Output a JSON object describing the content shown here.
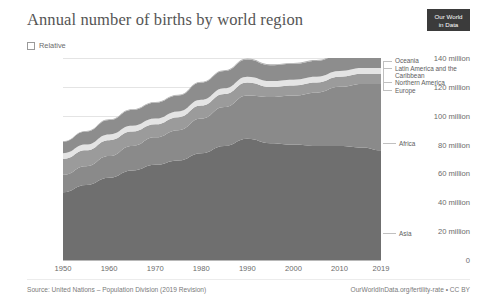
{
  "header": {
    "title": "Annual number of births by world region",
    "logo_line1": "Our World",
    "logo_line2": "in Data",
    "relative_label": "Relative"
  },
  "footer": {
    "source": "Source: United Nations – Population Division (2019 Revision)",
    "attribution": "OurWorldInData.org/fertility-rate • CC BY"
  },
  "legend": {
    "oceania": "Oceania",
    "latin_america": "Latin America and the Caribbean",
    "northern_america": "Northern America",
    "europe": "Europe",
    "africa": "Africa",
    "asia": "Asia"
  },
  "chart_data": {
    "type": "area",
    "title": "Annual number of births by world region",
    "subtitle": "",
    "xlabel": "",
    "ylabel": "",
    "stacked": true,
    "grid": true,
    "legend_position": "right",
    "xlim": [
      1950,
      2019
    ],
    "ylim": [
      0,
      140
    ],
    "y_unit": "million",
    "yticks": [
      0,
      20,
      40,
      60,
      80,
      100,
      120,
      140
    ],
    "ytick_labels": [
      "0",
      "20 million",
      "40 million",
      "60 million",
      "80 million",
      "100 million",
      "120 million",
      "140 million"
    ],
    "xticks": [
      1950,
      1960,
      1970,
      1980,
      1990,
      2000,
      2010,
      2019
    ],
    "xtick_labels": [
      "1950",
      "1960",
      "1970",
      "1980",
      "1990",
      "2000",
      "2010",
      "2019"
    ],
    "x": [
      1950,
      1955,
      1960,
      1965,
      1970,
      1975,
      1980,
      1985,
      1990,
      1995,
      2000,
      2005,
      2010,
      2015,
      2019
    ],
    "series": [
      {
        "name": "Asia",
        "color": "#6f6f6f",
        "values": [
          47,
          52,
          57,
          62,
          66,
          69,
          74,
          79,
          84,
          81,
          80,
          79,
          79,
          78,
          76
        ]
      },
      {
        "name": "Africa",
        "color": "#8a8a8a",
        "values": [
          12,
          13,
          15,
          17,
          19,
          21,
          24,
          27,
          30,
          32,
          34,
          37,
          41,
          44,
          46
        ]
      },
      {
        "name": "Europe",
        "color": "#9b9b9b",
        "values": [
          11,
          11,
          11,
          10,
          9,
          9,
          9,
          9,
          9,
          7,
          7,
          7,
          7,
          7,
          7
        ]
      },
      {
        "name": "Northern America",
        "color": "#e4e4e4",
        "values": [
          4,
          4,
          4,
          4,
          4,
          4,
          4,
          4,
          4,
          4,
          4,
          4,
          4,
          4,
          4
        ]
      },
      {
        "name": "Latin America and the Caribbean",
        "color": "#8d8d8d",
        "values": [
          8,
          9,
          10,
          11,
          11,
          11,
          12,
          12,
          12,
          11,
          11,
          11,
          11,
          10,
          10
        ]
      },
      {
        "name": "Oceania",
        "color": "#b0b0b0",
        "values": [
          0.4,
          0.4,
          0.5,
          0.5,
          0.5,
          0.5,
          0.5,
          0.5,
          0.6,
          0.6,
          0.6,
          0.6,
          0.6,
          0.7,
          0.7
        ]
      }
    ],
    "totals": [
      82.4,
      89.4,
      97.5,
      104.5,
      109.5,
      114.5,
      123.5,
      131.5,
      139.6,
      135.6,
      136.6,
      138.6,
      142.6,
      143.7,
      143.7
    ]
  }
}
